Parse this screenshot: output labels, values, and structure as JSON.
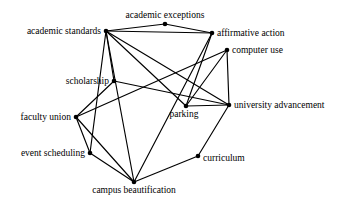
{
  "diagram": {
    "type": "node-link-network",
    "title": "",
    "width": 342,
    "height": 207,
    "background_color": "#ffffff",
    "edge_color": "#000000",
    "node_color": "#000000",
    "nodes": [
      {
        "id": "academic_standards",
        "label": "academic standards",
        "x": 106,
        "y": 31,
        "label_pos": "left",
        "label_dx": -5,
        "label_dy": 0
      },
      {
        "id": "academic_exceptions",
        "label": "academic exceptions",
        "x": 165,
        "y": 24,
        "label_pos": "above",
        "label_dx": 0,
        "label_dy": -4
      },
      {
        "id": "affirmative_action",
        "label": "affirmative action",
        "x": 212,
        "y": 33,
        "label_pos": "right",
        "label_dx": 5,
        "label_dy": 0
      },
      {
        "id": "computer_use",
        "label": "computer use",
        "x": 227,
        "y": 50,
        "label_pos": "right",
        "label_dx": 5,
        "label_dy": 0
      },
      {
        "id": "scholarship",
        "label": "scholarship",
        "x": 114,
        "y": 81,
        "label_pos": "left",
        "label_dx": -5,
        "label_dy": 0
      },
      {
        "id": "university_advancement",
        "label": "university advancement",
        "x": 229,
        "y": 105,
        "label_pos": "right",
        "label_dx": 5,
        "label_dy": 0
      },
      {
        "id": "parking",
        "label": "parking",
        "x": 186,
        "y": 106,
        "label_pos": "below",
        "label_dx": -2,
        "label_dy": 3
      },
      {
        "id": "faculty_union",
        "label": "faculty union",
        "x": 76,
        "y": 117,
        "label_pos": "left",
        "label_dx": -5,
        "label_dy": 0
      },
      {
        "id": "event_scheduling",
        "label": "event scheduling",
        "x": 90,
        "y": 153,
        "label_pos": "left",
        "label_dx": -5,
        "label_dy": 0
      },
      {
        "id": "curriculum",
        "label": "curriculum",
        "x": 198,
        "y": 156,
        "label_pos": "right",
        "label_dx": 5,
        "label_dy": 2
      },
      {
        "id": "campus_beautification",
        "label": "campus beautification",
        "x": 134,
        "y": 182,
        "label_pos": "below",
        "label_dx": 0,
        "label_dy": 3
      }
    ],
    "edges": [
      {
        "source": "academic_standards",
        "target": "academic_exceptions"
      },
      {
        "source": "academic_standards",
        "target": "affirmative_action"
      },
      {
        "source": "academic_exceptions",
        "target": "affirmative_action"
      },
      {
        "source": "academic_standards",
        "target": "scholarship"
      },
      {
        "source": "academic_standards",
        "target": "parking"
      },
      {
        "source": "academic_standards",
        "target": "university_advancement"
      },
      {
        "source": "academic_standards",
        "target": "event_scheduling"
      },
      {
        "source": "academic_standards",
        "target": "campus_beautification"
      },
      {
        "source": "affirmative_action",
        "target": "parking"
      },
      {
        "source": "affirmative_action",
        "target": "campus_beautification"
      },
      {
        "source": "computer_use",
        "target": "university_advancement"
      },
      {
        "source": "computer_use",
        "target": "parking"
      },
      {
        "source": "computer_use",
        "target": "faculty_union"
      },
      {
        "source": "parking",
        "target": "university_advancement"
      },
      {
        "source": "scholarship",
        "target": "faculty_union"
      },
      {
        "source": "scholarship",
        "target": "university_advancement"
      },
      {
        "source": "faculty_union",
        "target": "event_scheduling"
      },
      {
        "source": "faculty_union",
        "target": "campus_beautification"
      },
      {
        "source": "event_scheduling",
        "target": "campus_beautification"
      },
      {
        "source": "curriculum",
        "target": "university_advancement"
      },
      {
        "source": "curriculum",
        "target": "campus_beautification"
      }
    ]
  }
}
